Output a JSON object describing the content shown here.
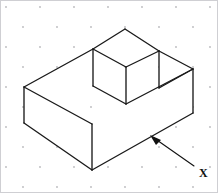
{
  "figure": {
    "background_color": "#ffffff",
    "line_color": "#1a1a1a",
    "dot_grid": {
      "name": "isometric-dot-grid",
      "dot_color": "#b9b9bd",
      "dot_radius": 0.9,
      "column_spacing": 17,
      "row_spacing": 20,
      "stagger": true
    },
    "callout": {
      "label": "X",
      "label_x": 201,
      "label_y": 174,
      "arrow_tail_x": 194,
      "arrow_tail_y": 166,
      "arrow_tip_x": 152,
      "arrow_tip_y": 136,
      "points_to": "front-right-bottom-face"
    },
    "geometry": {
      "units": "pixels",
      "projection": "isometric",
      "vertices": {
        "top_apex": [
          125,
          29
        ],
        "top_left_step": [
          93,
          49
        ],
        "top_right_step": [
          159,
          51
        ],
        "right_top": [
          193,
          69
        ],
        "left_top": [
          24,
          87
        ],
        "left_bottom": [
          24,
          123
        ],
        "front_bottom": [
          92,
          170
        ],
        "right_bottom": [
          193,
          113
        ],
        "inner_step_left": [
          93,
          86
        ],
        "inner_step_mid": [
          126,
          67
        ],
        "inner_step_low": [
          126,
          104
        ],
        "inner_front": [
          92,
          124
        ],
        "notch_right_low": [
          159,
          88
        ],
        "notch_right_edge": [
          193,
          69
        ]
      },
      "faces": [
        "top-rear-face",
        "top-step-face",
        "left-side-face",
        "front-lower-face",
        "right-side-face",
        "notch-vertical-face",
        "notch-angled-face"
      ]
    }
  }
}
